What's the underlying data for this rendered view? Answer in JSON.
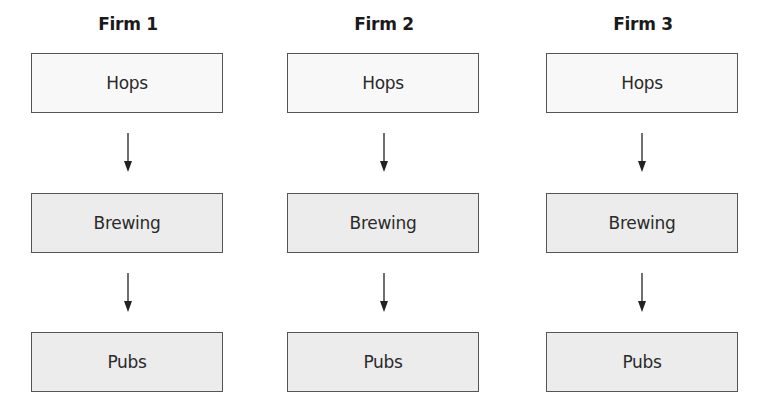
{
  "diagram": {
    "columns": [
      {
        "title": "Firm 1",
        "stages": [
          "Hops",
          "Brewing",
          "Pubs"
        ]
      },
      {
        "title": "Firm 2",
        "stages": [
          "Hops",
          "Brewing",
          "Pubs"
        ]
      },
      {
        "title": "Firm 3",
        "stages": [
          "Hops",
          "Brewing",
          "Pubs"
        ]
      }
    ],
    "colors": {
      "border": "#555555",
      "hops_fill": "#f8f8f8",
      "stage_fill": "#ececec",
      "arrow": "#222222"
    }
  }
}
